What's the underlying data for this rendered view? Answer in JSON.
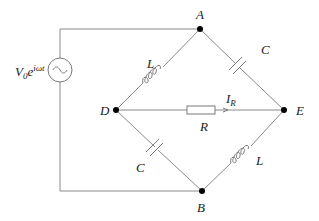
{
  "diagram": {
    "type": "ac-bridge-circuit",
    "source": {
      "label_main": "V",
      "label_sub": "0",
      "label_e": "e",
      "label_sup": "iωt",
      "symbol": "~"
    },
    "nodes": [
      {
        "id": "A",
        "label": "A"
      },
      {
        "id": "B",
        "label": "B"
      },
      {
        "id": "D",
        "label": "D"
      },
      {
        "id": "E",
        "label": "E"
      }
    ],
    "components": [
      {
        "id": "L_AD",
        "label": "L",
        "type": "inductor",
        "between": [
          "D",
          "A"
        ]
      },
      {
        "id": "C_AE",
        "label": "C",
        "type": "capacitor",
        "between": [
          "A",
          "E"
        ]
      },
      {
        "id": "R_DE",
        "label": "R",
        "type": "resistor",
        "between": [
          "D",
          "E"
        ]
      },
      {
        "id": "C_DB",
        "label": "C",
        "type": "capacitor",
        "between": [
          "D",
          "B"
        ]
      },
      {
        "id": "L_BE",
        "label": "L",
        "type": "inductor",
        "between": [
          "B",
          "E"
        ]
      }
    ],
    "current": {
      "label_main": "I",
      "label_sub": "R"
    }
  }
}
